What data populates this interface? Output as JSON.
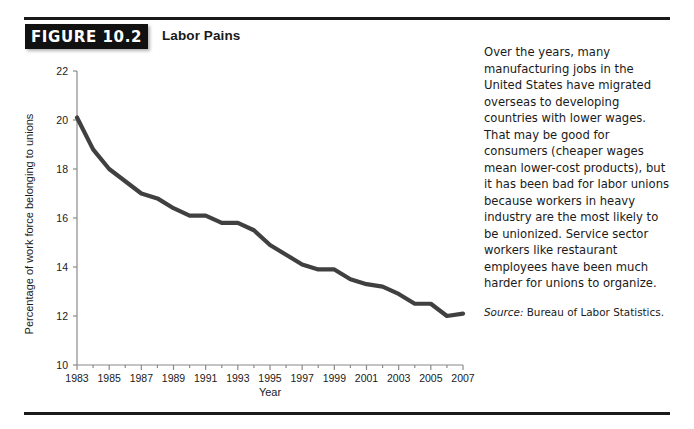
{
  "figure": {
    "badge": "FIGURE 10.2",
    "title": "Labor Pains"
  },
  "sidebar": {
    "body": "Over the years, many manufacturing jobs in the United States have migrated overseas to developing countries with lower wages. That may be good for consumers (cheaper wages mean lower-cost products), but it has been bad for labor unions because workers in heavy industry are the most likely to be unionized. Service sector workers like restaurant employees have been much harder for unions to organize.",
    "source_lead": "Source:",
    "source_text": " Bureau of Labor Statistics."
  },
  "colors": {
    "line": "#404040",
    "axis": "#8a8a8a",
    "text": "#1a1a1a",
    "badge_bg": "#111111",
    "rule": "#1a1a1a"
  },
  "chart_data": {
    "type": "line",
    "title": "Labor Pains",
    "xlabel": "Year",
    "ylabel": "Percentage of work force belonging to unions",
    "xlim": [
      1983,
      2007
    ],
    "ylim": [
      10,
      22
    ],
    "ytick_step": 2,
    "yticks": [
      10,
      12,
      14,
      16,
      18,
      20,
      22
    ],
    "xticks": [
      1983,
      1985,
      1987,
      1989,
      1991,
      1993,
      1995,
      1997,
      1999,
      2001,
      2003,
      2005,
      2007
    ],
    "xticks_minor_step": 1,
    "grid": false,
    "legend": false,
    "x": [
      1983,
      1984,
      1985,
      1986,
      1987,
      1988,
      1989,
      1990,
      1991,
      1992,
      1993,
      1994,
      1995,
      1996,
      1997,
      1998,
      1999,
      2000,
      2001,
      2002,
      2003,
      2004,
      2005,
      2006,
      2007
    ],
    "values": [
      20.1,
      18.8,
      18.0,
      17.5,
      17.0,
      16.8,
      16.4,
      16.1,
      16.1,
      15.8,
      15.8,
      15.5,
      14.9,
      14.5,
      14.1,
      13.9,
      13.9,
      13.5,
      13.3,
      13.2,
      12.9,
      12.5,
      12.5,
      12.0,
      12.1
    ],
    "series": [
      {
        "name": "Percentage of work force belonging to unions",
        "values": [
          20.1,
          18.8,
          18.0,
          17.5,
          17.0,
          16.8,
          16.4,
          16.1,
          16.1,
          15.8,
          15.8,
          15.5,
          14.9,
          14.5,
          14.1,
          13.9,
          13.9,
          13.5,
          13.3,
          13.2,
          12.9,
          12.5,
          12.5,
          12.0,
          12.1
        ]
      }
    ]
  }
}
